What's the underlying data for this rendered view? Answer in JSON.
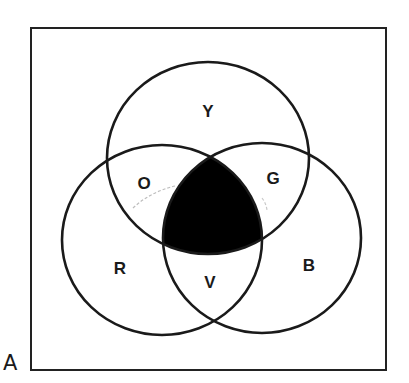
{
  "figure": {
    "label": "A"
  },
  "universe_box": {
    "x1": 31,
    "y1": 28,
    "x2": 386,
    "y2": 370,
    "stroke": "#222222"
  },
  "circles": [
    {
      "name": "yellow",
      "cx": 208,
      "cy": 158,
      "rx": 101,
      "ry": 96
    },
    {
      "name": "red",
      "cx": 162,
      "cy": 240,
      "rx": 100,
      "ry": 95
    },
    {
      "name": "blue",
      "cx": 262,
      "cy": 238,
      "rx": 99,
      "ry": 95
    }
  ],
  "regions": {
    "Y": {
      "label": "Y",
      "x": 208,
      "y": 117
    },
    "O": {
      "label": "O",
      "x": 144,
      "y": 189
    },
    "G": {
      "label": "G",
      "x": 273,
      "y": 184
    },
    "R": {
      "label": "R",
      "x": 120,
      "y": 274
    },
    "B": {
      "label": "B",
      "x": 309,
      "y": 271
    },
    "V": {
      "label": "V",
      "x": 210,
      "y": 288
    }
  },
  "shaded_region": {
    "description": "intersection of all three circles",
    "fill": "#000000"
  },
  "colors": {
    "stroke": "#1a1a1a",
    "shade": "#000000",
    "background": "#ffffff",
    "faint_arc": "#bdbdbd"
  }
}
